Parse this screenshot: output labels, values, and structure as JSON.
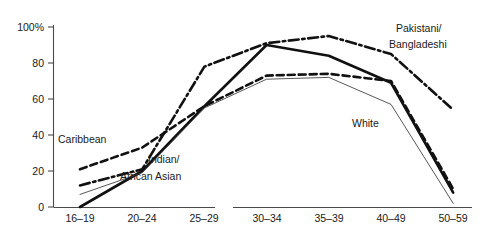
{
  "chart_data": {
    "type": "line",
    "title": "",
    "subtitle": "",
    "xlabel": "",
    "ylabel": "",
    "categories": [
      "16–19",
      "20–24",
      "25–29",
      "30–34",
      "35–39",
      "40–49",
      "50–59"
    ],
    "ylim": [
      0,
      100
    ],
    "xlim_note": "categorical, equally spaced, gap between 25-29 and 30-34 in axis rule",
    "yticks": [
      0,
      20,
      40,
      60,
      80,
      100
    ],
    "ytick_labels": [
      "0",
      "20",
      "40",
      "60",
      "80",
      "100%"
    ],
    "grid": false,
    "legend": "inline annotations next to lines",
    "series": [
      {
        "name": "Pakistani/Bangladeshi",
        "style": "dash-dot",
        "width": "thick",
        "color": "#111111",
        "values": [
          12,
          21,
          78,
          91,
          95,
          85,
          54
        ]
      },
      {
        "name": "Caribbean",
        "style": "dashed",
        "width": "thick",
        "color": "#111111",
        "values": [
          21,
          33,
          56,
          73,
          74,
          70,
          10
        ]
      },
      {
        "name": "Indian/African Asian",
        "style": "solid",
        "width": "thick",
        "color": "#111111",
        "values": [
          0,
          20,
          56,
          90,
          84,
          69,
          8
        ]
      },
      {
        "name": "White",
        "style": "solid",
        "width": "thin",
        "color": "#444444",
        "values": [
          7,
          19,
          55,
          71,
          72,
          57,
          2
        ]
      }
    ],
    "annotations": [
      {
        "text": "Caribbean",
        "x": 58,
        "y": 143
      },
      {
        "text": "Indian/",
        "x": 148,
        "y": 163
      },
      {
        "text": "African Asian",
        "x": 120,
        "y": 180
      },
      {
        "text": "Pakistani/",
        "x": 396,
        "y": 32
      },
      {
        "text": "Bangladeshi",
        "x": 389,
        "y": 48
      },
      {
        "text": "White",
        "x": 352,
        "y": 127
      }
    ]
  },
  "axis": {
    "y_tick_text": [
      "100%",
      "80",
      "60",
      "40",
      "20",
      "0"
    ],
    "x_tick_text": [
      "16–19",
      "20–24",
      "25–29",
      "30–34",
      "35–39",
      "40–49",
      "50–59"
    ]
  }
}
